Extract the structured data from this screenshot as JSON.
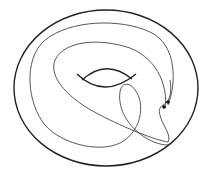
{
  "diagram": {
    "colors": {
      "background": "#ffffff",
      "outline": "#222222",
      "curve": "#444444",
      "point": "#111111"
    },
    "elements": [
      {
        "id": "torus-outline",
        "type": "ellipse"
      },
      {
        "id": "torus-hole",
        "type": "arcs"
      },
      {
        "id": "curve",
        "type": "closed-curve"
      },
      {
        "id": "point-a",
        "type": "point"
      },
      {
        "id": "point-b",
        "type": "point"
      }
    ]
  }
}
